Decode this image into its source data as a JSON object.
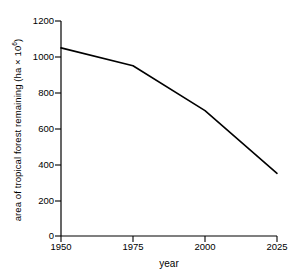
{
  "chart_data": {
    "type": "line",
    "title": "",
    "xlabel": "year",
    "ylabel": "area of tropical forest remaining (ha × 10⁶)",
    "ylabel_text": "area of tropical forest remaining (ha × 10",
    "ylabel_exponent": "6",
    "ylabel_tail": ")",
    "x": [
      1950,
      1975,
      2000,
      2025
    ],
    "values": [
      1050,
      950,
      700,
      350
    ],
    "series": [
      {
        "name": "tropical forest area",
        "values": [
          1050,
          950,
          700,
          350
        ]
      }
    ],
    "xlim": [
      1950,
      2025
    ],
    "ylim": [
      0,
      1200
    ],
    "xticks": [
      1950,
      1975,
      2000,
      2025
    ],
    "yticks": [
      0,
      200,
      400,
      600,
      800,
      1000,
      1200
    ],
    "xtick_labels": [
      "1950",
      "1975",
      "2000",
      "2025"
    ],
    "ytick_labels": [
      "0",
      "200",
      "400",
      "600",
      "800",
      "1000",
      "1200"
    ],
    "grid": false,
    "legend": null,
    "line_color": "#000000",
    "axis_color": "#000000",
    "background_color": "#ffffff",
    "markers": false
  }
}
